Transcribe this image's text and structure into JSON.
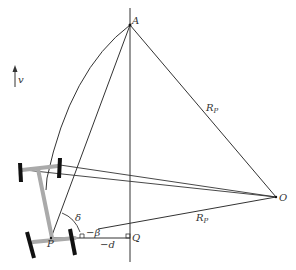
{
  "diagram": {
    "labels": {
      "A": "A",
      "O": "O",
      "P": "P",
      "Q": "Q",
      "v": "v",
      "Rp_upper": "R",
      "Rp_upper_sub": "P",
      "Rp_lower": "R",
      "Rp_lower_sub": "P",
      "delta": "δ",
      "beta": "−β",
      "d": "−d"
    },
    "colors": {
      "line": "#333333",
      "chassis": "#aaaaaa",
      "wheel": "#111111"
    }
  }
}
